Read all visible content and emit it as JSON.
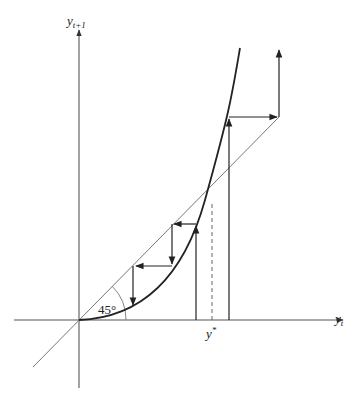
{
  "diagram": {
    "type": "cobweb-diagram",
    "axes": {
      "x_label": {
        "base": "y",
        "sub": "t"
      },
      "y_label": {
        "base": "y",
        "sub": "t+1"
      }
    },
    "angle_label": "45°",
    "fixed_point_label": {
      "base": "y",
      "sup": "*"
    },
    "elements": [
      {
        "name": "45-degree-line",
        "description": "identity line y_{t+1} = y_t"
      },
      {
        "name": "convex-curve",
        "description": "convex map through origin, crossing 45° line at y*"
      },
      {
        "name": "cobweb-path-left",
        "description": "starting below y*, iterates converge to origin"
      },
      {
        "name": "cobweb-path-right",
        "description": "starting above y*, iterates diverge upward"
      },
      {
        "name": "fixed-point-dashed-line",
        "description": "dashed vertical at y*"
      }
    ]
  },
  "colors": {
    "axis": "#555555",
    "curve": "#222222",
    "diagonal": "#777777",
    "arrows": "#222222"
  }
}
